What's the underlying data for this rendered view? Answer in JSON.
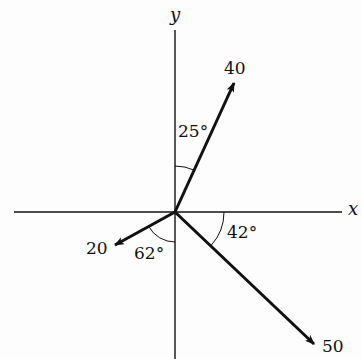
{
  "diagram": {
    "type": "vector-diagram",
    "axes": {
      "x_label": "x",
      "y_label": "y"
    },
    "vectors": [
      {
        "magnitude_label": "40",
        "angle_label": "25°",
        "angle_reference": "from +y axis toward +x"
      },
      {
        "magnitude_label": "50",
        "angle_label": "42°",
        "angle_reference": "below +x axis"
      },
      {
        "magnitude_label": "20",
        "angle_label": "62°",
        "angle_reference": "from -y axis toward -x"
      }
    ],
    "colors": {
      "line": "#111111",
      "background": "#fdfdfd"
    }
  }
}
